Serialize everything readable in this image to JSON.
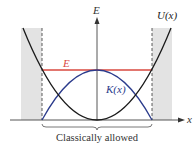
{
  "diagram": {
    "labels": {
      "energy_axis": "E",
      "position_axis": "x",
      "potential": "U(x)",
      "kinetic": "K(x)",
      "energy_level": "E",
      "region": "Classically allowed"
    },
    "colors": {
      "potential": "#1a1a1a",
      "kinetic": "#2b3b8c",
      "energy_level": "#d9483f",
      "forbidden_region": "#e3e3e3",
      "axes": "#333333"
    }
  }
}
